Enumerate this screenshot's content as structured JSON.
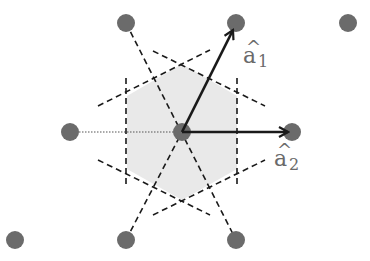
{
  "diagram": {
    "colors": {
      "lattice_point": "#6b6b6b",
      "cell_fill": "#e9e9e9",
      "dashed": "#1a1a1a",
      "vector": "#1a1a1a",
      "label": "#6a6a6a"
    },
    "lattice_points": [
      {
        "x": 126,
        "y": 23
      },
      {
        "x": 236,
        "y": 23
      },
      {
        "x": 348,
        "y": 23
      },
      {
        "x": 70,
        "y": 132
      },
      {
        "x": 182,
        "y": 132
      },
      {
        "x": 292,
        "y": 132
      },
      {
        "x": 15,
        "y": 240
      },
      {
        "x": 126,
        "y": 240
      },
      {
        "x": 236,
        "y": 240
      }
    ],
    "cell_hexagon": "182,64 127,96 127,169 182,200 237,169 237,96",
    "vectors": [
      {
        "name": "a1",
        "label_base": "a",
        "label_hat": "^",
        "label_sub": "1",
        "from": [
          182,
          132
        ],
        "to": [
          234,
          28
        ]
      },
      {
        "name": "a2",
        "label_base": "a",
        "label_hat": "^",
        "label_sub": "2",
        "from": [
          182,
          132
        ],
        "to": [
          290,
          132
        ]
      }
    ],
    "labels": {
      "a1_base": "a",
      "a1_hat": "^",
      "a1_sub": "1",
      "a2_base": "a",
      "a2_hat": "^",
      "a2_sub": "2"
    }
  }
}
